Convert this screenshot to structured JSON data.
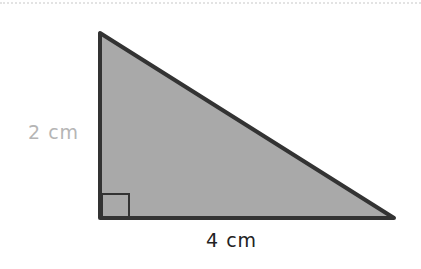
{
  "figure": {
    "shape": "right-triangle",
    "fill_color": "#a9a9a9",
    "stroke_color": "#333333",
    "height_label": "2 cm",
    "height_label_color": "#b5b5b5",
    "base_label": "4 cm",
    "base_label_color": "#222222",
    "right_angle_marker": true
  }
}
